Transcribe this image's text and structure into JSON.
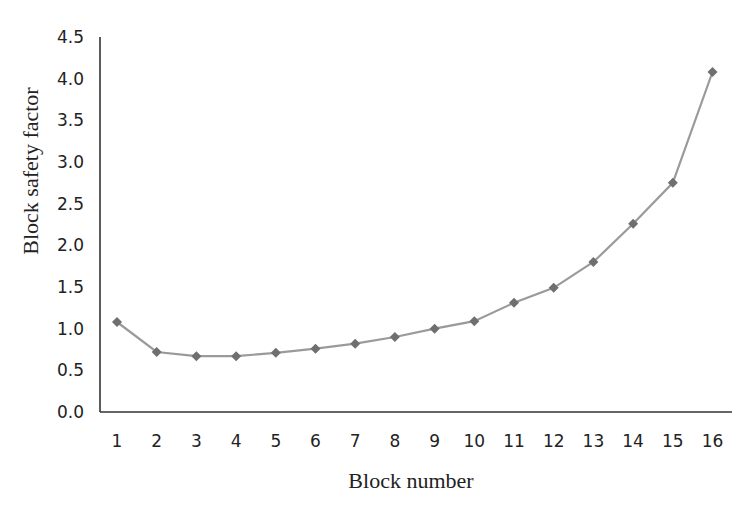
{
  "chart_data": {
    "type": "line",
    "title": "",
    "xlabel": "Block number",
    "ylabel": "Block safety factor",
    "categories": [
      "1",
      "2",
      "3",
      "4",
      "5",
      "6",
      "7",
      "8",
      "9",
      "10",
      "11",
      "12",
      "13",
      "14",
      "15",
      "16"
    ],
    "series": [
      {
        "name": "Block safety factor",
        "marker": "diamond",
        "color": "#9a9a9a",
        "marker_color": "#6f6f6f",
        "values": [
          1.08,
          0.72,
          0.67,
          0.67,
          0.71,
          0.76,
          0.82,
          0.9,
          1.0,
          1.09,
          1.31,
          1.49,
          1.8,
          2.26,
          2.75,
          4.08
        ]
      }
    ],
    "ylim": [
      0.0,
      4.5
    ],
    "yticks": [
      "0.0",
      "0.5",
      "1.0",
      "1.5",
      "2.0",
      "2.5",
      "3.0",
      "3.5",
      "4.0",
      "4.5"
    ],
    "grid": false,
    "legend": null
  },
  "colors": {
    "axis": "#333333",
    "line": "#9a9a9a",
    "marker": "#6f6f6f",
    "text": "#222222"
  }
}
